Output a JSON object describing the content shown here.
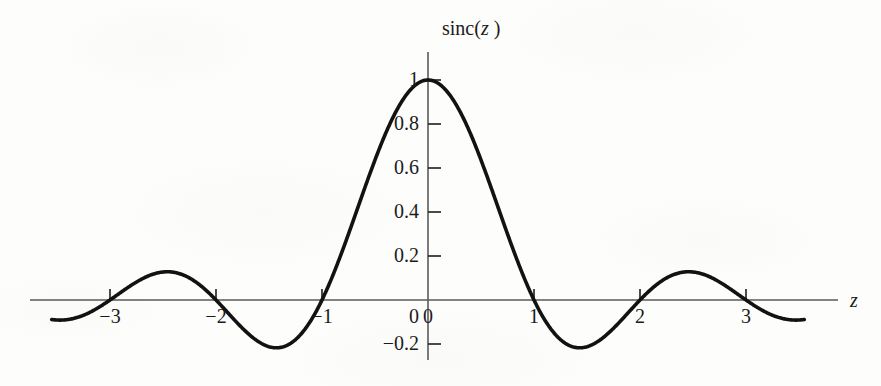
{
  "chart_data": {
    "type": "line",
    "title": "",
    "subtitle": "",
    "xlabel": "z",
    "ylabel": "sinc(z)",
    "function": "sinc(z) = sin(pi*z)/(pi*z)",
    "grid": false,
    "legend": null,
    "xlim": [
      -3.55,
      3.55
    ],
    "ylim": [
      -0.25,
      1.05
    ],
    "xticks": [
      -3,
      -2,
      -1,
      0,
      1,
      2,
      3
    ],
    "xticklabels": [
      "−3",
      "−2",
      "−1",
      "0",
      "1",
      "2",
      "3"
    ],
    "yticks": [
      -0.2,
      0,
      0.2,
      0.4,
      0.6,
      0.8,
      1
    ],
    "yticklabels": [
      "−0.2",
      "0",
      "0.2",
      "0.4",
      "0.6",
      "0.8",
      "1"
    ],
    "x": [
      -3.5,
      -3.4,
      -3.3,
      -3.2,
      -3.1,
      -3.0,
      -2.9,
      -2.8,
      -2.7,
      -2.6,
      -2.5,
      -2.4,
      -2.3,
      -2.2,
      -2.1,
      -2.0,
      -1.9,
      -1.8,
      -1.7,
      -1.6,
      -1.5,
      -1.4,
      -1.3,
      -1.2,
      -1.1,
      -1.0,
      -0.9,
      -0.8,
      -0.7,
      -0.6,
      -0.5,
      -0.4,
      -0.3,
      -0.2,
      -0.1,
      0.0,
      0.1,
      0.2,
      0.3,
      0.4,
      0.5,
      0.6,
      0.7,
      0.8,
      0.9,
      1.0,
      1.1,
      1.2,
      1.3,
      1.4,
      1.5,
      1.6,
      1.7,
      1.8,
      1.9,
      2.0,
      2.1,
      2.2,
      2.3,
      2.4,
      2.5,
      2.6,
      2.7,
      2.8,
      2.9,
      3.0,
      3.1,
      3.2,
      3.3,
      3.4
    ],
    "y": [
      -0.0909,
      -0.0927,
      -0.0865,
      -0.073,
      -0.0534,
      -0.0,
      0.0332,
      0.0682,
      0.1014,
      0.1296,
      0.1273,
      0.1247,
      0.1073,
      0.0758,
      0.0337,
      0.0,
      -0.0502,
      -0.1053,
      -0.1592,
      -0.2053,
      -0.2122,
      -0.2162,
      -0.1913,
      -0.1559,
      -0.0895,
      0.0,
      0.1093,
      0.2339,
      0.3679,
      0.5046,
      0.6366,
      0.7568,
      0.8584,
      0.9355,
      0.9836,
      1.0,
      0.9836,
      0.9355,
      0.8584,
      0.7568,
      0.6366,
      0.5046,
      0.3679,
      0.2339,
      0.1093,
      0.0,
      -0.0895,
      -0.1559,
      -0.1913,
      -0.2162,
      -0.2122,
      -0.2053,
      -0.1592,
      -0.1053,
      -0.0502,
      0.0,
      0.0337,
      0.0758,
      0.1073,
      0.1247,
      0.1273,
      0.1296,
      0.1014,
      0.0682,
      0.0332,
      0.0,
      -0.0534,
      -0.073,
      -0.0865,
      -0.0927
    ],
    "annotations": {
      "peak": {
        "x": 0,
        "y": 1
      },
      "zeros": [
        -3,
        -2,
        -1,
        1,
        2,
        3
      ],
      "local_minima": [
        {
          "x": -1.43,
          "y": -0.217
        },
        {
          "x": 1.43,
          "y": -0.217
        }
      ],
      "local_maxima": [
        {
          "x": -2.46,
          "y": 0.128
        },
        {
          "x": 2.46,
          "y": 0.128
        }
      ]
    }
  },
  "axes": {
    "y_label_prefix": "sinc(",
    "y_label_var": "z",
    "y_label_suffix": " )",
    "x_label_var": "z"
  },
  "colors": {
    "background": "#fdfdfc",
    "curve": "#121212",
    "axis": "#5a5a5a",
    "tick": "#2a2a2a",
    "text": "#1b1b1b"
  }
}
